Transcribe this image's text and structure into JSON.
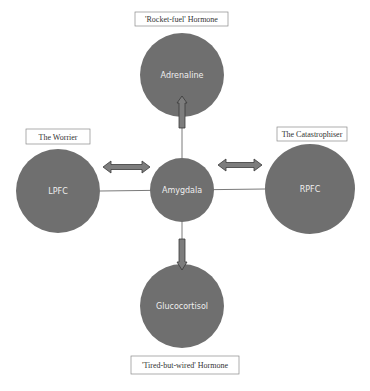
{
  "colors": {
    "circle_fill": "#6f6f6f",
    "arrow_fill": "#7d7d7d",
    "arrow_stroke": "#3a3a3a",
    "line": "#7a7a7a",
    "box_stroke": "#8a8a8a",
    "circle_text": "#eeeeee",
    "box_text": "#333333"
  },
  "nodes": {
    "adrenaline": {
      "label": "Adrenaline"
    },
    "amygdala": {
      "label": "Amygdala"
    },
    "lpfc": {
      "label": "LPFC"
    },
    "rpfc": {
      "label": "RPFC"
    },
    "glucocortisol": {
      "label": "Glucocortisol"
    }
  },
  "annotations": {
    "top": "'Rocket-fuel' Hormone",
    "left": "The Worrier",
    "right": "The Catastrophiser",
    "bottom": "'Tired-but-wired' Hormone"
  }
}
